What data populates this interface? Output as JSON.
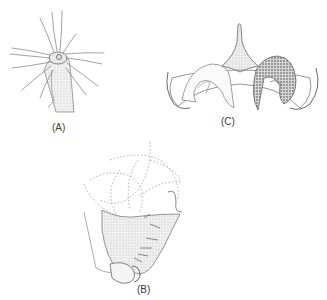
{
  "figure": {
    "panels": [
      {
        "id": "A",
        "label": "(A)",
        "subject": "tentacled-tube-organism"
      },
      {
        "id": "B",
        "label": "(B)",
        "subject": "lateral-view-appendage"
      },
      {
        "id": "C",
        "label": "(C)",
        "subject": "bilobed-symmetric-structure"
      }
    ]
  },
  "colors": {
    "line": "#6a6a6a",
    "stipple": "#c8c8c8",
    "dark_stipple": "#9a9a9a",
    "label": "#3a3a3a"
  }
}
